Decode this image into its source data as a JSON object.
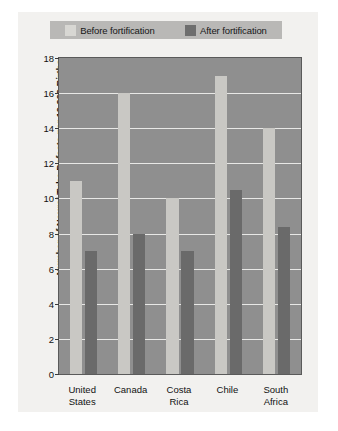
{
  "chart_data": {
    "type": "bar",
    "title": "",
    "xlabel": "",
    "ylabel": "Number of Neural Tube Defects per 10,000 Births",
    "categories": [
      "United States",
      "Canada",
      "Costa Rica",
      "Chile",
      "South Africa"
    ],
    "category_lines": [
      [
        "United",
        "States"
      ],
      [
        "Canada"
      ],
      [
        "Costa",
        "Rica"
      ],
      [
        "Chile"
      ],
      [
        "South",
        "Africa"
      ]
    ],
    "series": [
      {
        "name": "Before fortification",
        "values": [
          11,
          16,
          10,
          17,
          14
        ],
        "color": "#c9c8c4"
      },
      {
        "name": "After fortification",
        "values": [
          7,
          8,
          7,
          10.5,
          8.4
        ],
        "color": "#6a6a6a"
      }
    ],
    "ylim": [
      0,
      18
    ],
    "ytick_step": 2,
    "yticks": [
      0,
      2,
      4,
      6,
      8,
      10,
      12,
      14,
      16,
      18
    ],
    "grid": true,
    "legend_position": "top"
  },
  "legend": {
    "entries": [
      {
        "label": "Before fortification",
        "swatch": "before-fortification-swatch"
      },
      {
        "label": "After fortification",
        "swatch": "after-fortification-swatch"
      }
    ]
  },
  "colors": {
    "plot_background": "#8f8f8f",
    "figure_background": "#f2f1ef",
    "gridline": "#e8e8e6",
    "legend_background": "#b9b8b6",
    "border": "#2b2b2b"
  }
}
